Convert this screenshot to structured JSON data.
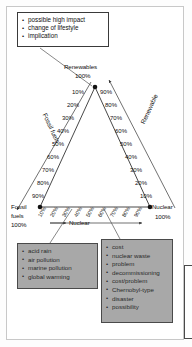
{
  "diagram": {
    "type": "ternary-triangle",
    "apex": {
      "label": "Renewables",
      "value": "100%"
    },
    "bottom_left": {
      "label_line1": "Fossil",
      "label_line2": "fuels",
      "value": "100%"
    },
    "bottom_right": {
      "label": "Nuclear",
      "value": "100%"
    },
    "axes": [
      {
        "name": "fossil-fuels-axis",
        "label": "Fossil fuels",
        "ticks": [
          "10%",
          "20%",
          "30%",
          "40%",
          "50%",
          "60%",
          "70%",
          "80%",
          "90%"
        ]
      },
      {
        "name": "renewable-axis",
        "label": "Renewable",
        "ticks": [
          "90%",
          "80%",
          "70%",
          "60%",
          "50%",
          "40%",
          "30%",
          "20%",
          "10%"
        ]
      },
      {
        "name": "nuclear-axis",
        "label": "Nuclear",
        "ticks": [
          "10%",
          "20%",
          "30%",
          "40%",
          "50%",
          "60%",
          "70%",
          "80%",
          "90%"
        ]
      }
    ],
    "left_inner_ticks": [
      "10%",
      "20%",
      "30%",
      "40%",
      "50%",
      "60%",
      "70%",
      "80%",
      "90%"
    ],
    "right_inner_ticks": [
      "90%",
      "80%",
      "70%",
      "60%",
      "50%",
      "40%",
      "30%",
      "20%",
      "10%"
    ]
  },
  "callout": {
    "name": "renewables-callout",
    "items": [
      "possible high impact",
      "change of lifestyle",
      "implication"
    ]
  },
  "fossil_box": {
    "name": "fossil-fuels-drawbacks",
    "items": [
      "acid rain",
      "air pollution",
      "marine pollution",
      "global warming"
    ]
  },
  "nuclear_box": {
    "name": "nuclear-drawbacks",
    "items": [
      "cost",
      "nuclear waste",
      "problem",
      "decommissioning",
      "cost/problem",
      "Chernobyl-type",
      "disaster",
      "possibility"
    ]
  },
  "colors": {
    "gray_box_fill": "#a8a8a8",
    "box_border": "#4a4a4a",
    "line": "#333333",
    "page_border": "#c8c8c8"
  }
}
